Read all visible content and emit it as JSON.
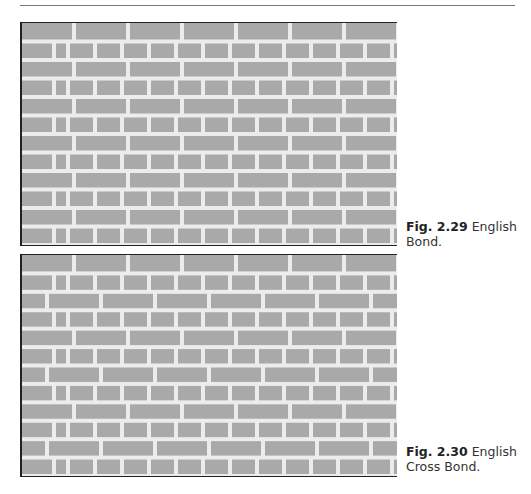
{
  "page": {
    "header_rule": true
  },
  "figures": [
    {
      "number": "Fig. 2.29",
      "title": "English Bond.",
      "pattern": "english-bond",
      "courses": 12,
      "first_course": "stretcher"
    },
    {
      "number": "Fig. 2.30",
      "title": "English Cross Bond.",
      "pattern": "english-cross-bond",
      "courses": 12,
      "first_course": "stretcher"
    }
  ],
  "colors": {
    "brick": "#a9a9a9",
    "mortar": "#ececec",
    "border": "#222222"
  },
  "captions": {
    "fig1_number": "Fig. 2.29",
    "fig1_title_line1": "English",
    "fig1_title_line2": "Bond.",
    "fig2_number": "Fig. 2.30",
    "fig2_title_line1": "English",
    "fig2_title_line2": "Cross Bond."
  }
}
